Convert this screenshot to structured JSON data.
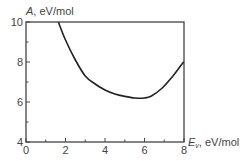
{
  "chart_data": {
    "type": "line",
    "title": "",
    "xlabel": "E_v, eV/mol",
    "xlabel_main": "E",
    "xlabel_sub": "v",
    "xlabel_unit": ", eV/mol",
    "ylabel": "A, eV/mol",
    "ylabel_main": "A",
    "ylabel_unit": ", eV/mol",
    "xlim": [
      0,
      8
    ],
    "ylim": [
      4,
      10
    ],
    "x_ticks": [
      0,
      2,
      4,
      6,
      8
    ],
    "y_ticks": [
      4,
      6,
      8,
      10
    ],
    "x_minor_ticks": [
      1,
      3,
      5,
      7
    ],
    "y_minor_ticks": [
      5,
      7,
      9
    ],
    "grid": false,
    "legend": null,
    "series": [
      {
        "name": "A(E_v)",
        "color": "#222222",
        "x": [
          1.64,
          2.0,
          2.5,
          3.0,
          3.5,
          4.0,
          4.5,
          5.0,
          5.5,
          6.0,
          6.35,
          6.9,
          7.4,
          7.9,
          8.0
        ],
        "y": [
          10.0,
          9.1,
          8.1,
          7.3,
          6.9,
          6.6,
          6.4,
          6.28,
          6.2,
          6.2,
          6.3,
          6.7,
          7.25,
          7.9,
          8.0
        ]
      }
    ]
  }
}
